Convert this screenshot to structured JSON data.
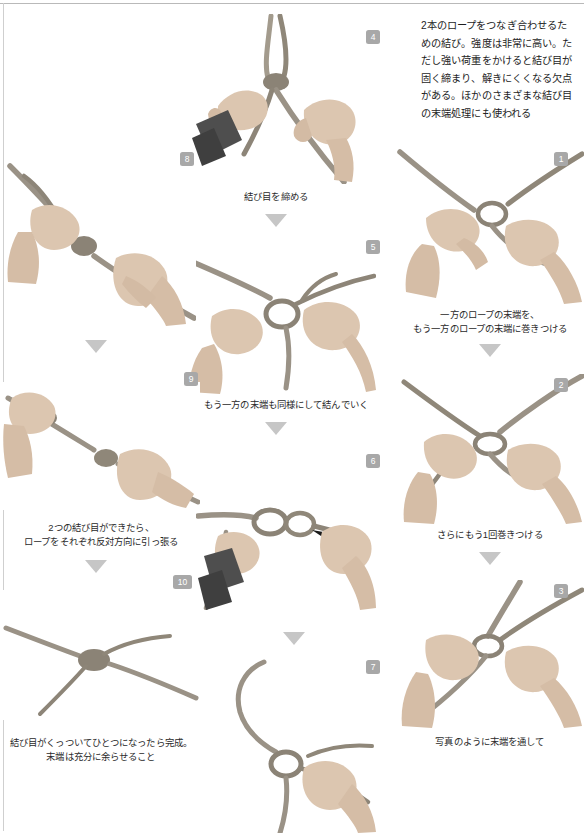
{
  "page": {
    "intro": "2本のロープをつなぎ合わせるための結び。強度は非常に高い。ただし強い荷重をかけると結び目が固く締まり、解きにくくなる欠点がある。ほかのさまざまな結び目の末端処理にも使われる"
  },
  "colors": {
    "badge_bg": "#a8a8a8",
    "badge_text": "#ffffff",
    "arrow": "#c6c6c6",
    "text": "#1d1d1d",
    "caption": "#2a2a2a",
    "rule": "#b9b9b9",
    "rope": "#9a9386",
    "skin": "#d8c3ae",
    "sleeve": "#4a4a4a"
  },
  "steps": [
    {
      "number": "1",
      "badge": "1",
      "caption": "一方のロープの末端を、\nもう一方のロープの末端に巻きつける",
      "column": "right",
      "has_arrow": true
    },
    {
      "number": "2",
      "badge": "2",
      "caption": "さらにもう1回巻きつける",
      "column": "right",
      "has_arrow": true
    },
    {
      "number": "3",
      "badge": "3",
      "caption": "写真のように末端を通して",
      "column": "right",
      "has_arrow": false
    },
    {
      "number": "4",
      "badge": "4",
      "caption": "結び目を締める",
      "column": "middle",
      "has_arrow": true
    },
    {
      "number": "5",
      "badge": "5",
      "caption": "もう一方の末端も同様にして結んでいく",
      "column": "middle",
      "has_arrow": true
    },
    {
      "number": "6",
      "badge": "6",
      "caption": "",
      "column": "middle",
      "has_arrow": true
    },
    {
      "number": "7",
      "badge": "7",
      "caption": "",
      "column": "middle",
      "has_arrow": false
    },
    {
      "number": "8",
      "badge": "8",
      "caption": "",
      "column": "left",
      "has_arrow": true
    },
    {
      "number": "9",
      "badge": "9",
      "caption": "2つの結び目ができたら、\nロープをそれぞれ反対方向に引っ張る",
      "column": "left",
      "has_arrow": true
    },
    {
      "number": "10",
      "badge": "10",
      "caption": "結び目がくっついてひとつになったら完成。\n末端は充分に余らせること",
      "column": "left",
      "has_arrow": false
    }
  ]
}
